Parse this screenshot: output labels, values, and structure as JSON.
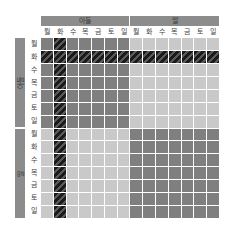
{
  "groups": [
    "아들",
    "딸"
  ],
  "days": [
    "월",
    "화",
    "수",
    "목",
    "금",
    "토",
    "일"
  ],
  "colors": {
    "header": "#8c8c8c",
    "same_group": "#7f7f7f",
    "cross_group": "#c9c9c9",
    "hatched_base": "#1a1a1a",
    "hatched_stripe": "#5a5a5a"
  },
  "hatched": {
    "row_index": 1,
    "col_index": 1
  },
  "grid_size": 14
}
